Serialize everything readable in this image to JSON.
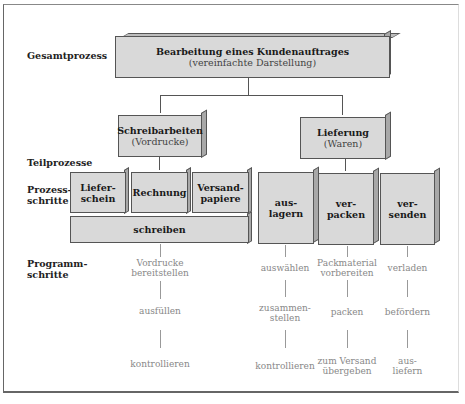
{
  "row_labels": {
    "gesamtprozess": "Gesamtprozess",
    "teilprozesse": "Teilprozesse",
    "prozessschritte_1": "Prozess-",
    "prozessschritte_2": "schritte",
    "programmschritte_1": "Programm-",
    "programmschritte_2": "schritte"
  },
  "gesamt": {
    "title": "Bearbeitung eines Kundenauftrages",
    "subtitle": "(vereinfachte Darstellung)"
  },
  "teil": [
    {
      "title": "Schreibarbeiten",
      "subtitle": "(Vordrucke)"
    },
    {
      "title": "Lieferung",
      "subtitle": "(Waren)"
    }
  ],
  "schreib_steps": [
    {
      "l1": "Liefer-",
      "l2": "schein"
    },
    {
      "l1": "Rechnung",
      "l2": ""
    },
    {
      "l1": "Versand-",
      "l2": "papiere"
    }
  ],
  "schreib_base": "schreiben",
  "liefer_steps": [
    {
      "l1": "aus-",
      "l2": "lagern"
    },
    {
      "l1": "ver-",
      "l2": "packen"
    },
    {
      "l1": "ver-",
      "l2": "senden"
    }
  ],
  "programm": {
    "schreiben": [
      {
        "l1": "Vordrucke",
        "l2": "bereitstellen"
      },
      {
        "l1": "ausfüllen",
        "l2": ""
      },
      {
        "l1": "kontrollieren",
        "l2": ""
      }
    ],
    "auslagern": [
      {
        "l1": "auswählen",
        "l2": ""
      },
      {
        "l1": "zusammen-",
        "l2": "stellen"
      },
      {
        "l1": "kontrollieren",
        "l2": ""
      }
    ],
    "verpacken": [
      {
        "l1": "Packmaterial",
        "l2": "vorbereiten"
      },
      {
        "l1": "packen",
        "l2": ""
      },
      {
        "l1": "zum Versand",
        "l2": "übergeben"
      }
    ],
    "versenden": [
      {
        "l1": "verladen",
        "l2": ""
      },
      {
        "l1": "befördern",
        "l2": ""
      },
      {
        "l1": "aus-",
        "l2": "liefern"
      }
    ]
  },
  "colors": {
    "box_face": "#d9d9d9",
    "box_side": "#a8a8a8",
    "box_top": "#bdbdbd",
    "programm_text": "#888888"
  }
}
